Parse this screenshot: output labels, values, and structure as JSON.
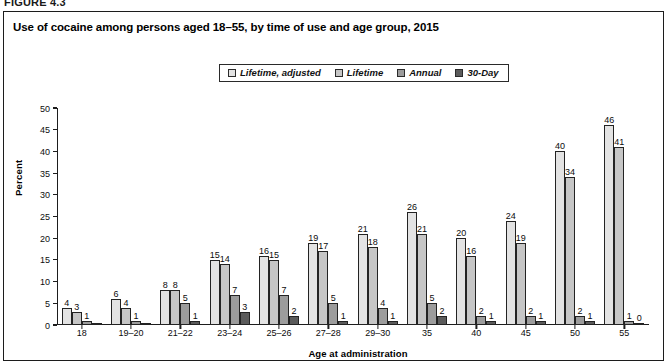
{
  "figure": {
    "label": "FIGURE 4.3"
  },
  "chart": {
    "title": "Use of cocaine among persons aged 18–55, by time of use and age group, 2015"
  },
  "legend": {
    "items": [
      {
        "label": "Lifetime, adjusted",
        "color": "#e3e3e3",
        "swatch_icon": "square-swatch-icon"
      },
      {
        "label": "Lifetime",
        "color": "#c6c6c6",
        "swatch_icon": "square-swatch-icon"
      },
      {
        "label": "Annual",
        "color": "#9c9c9c",
        "swatch_icon": "square-swatch-icon"
      },
      {
        "label": "30-Day",
        "color": "#5b5b5b",
        "swatch_icon": "square-swatch-icon"
      }
    ]
  },
  "chart_data": {
    "type": "bar",
    "title": "Use of cocaine among persons aged 18–55, by time of use and age group, 2015",
    "xlabel": "Age at administration",
    "ylabel": "Percent",
    "ylim": [
      0,
      50
    ],
    "yticks": [
      0,
      5,
      10,
      15,
      20,
      25,
      30,
      35,
      40,
      45,
      50
    ],
    "grid": false,
    "legend_position": "top-center",
    "categories": [
      "18",
      "19–20",
      "21–22",
      "23–24",
      "25–26",
      "27–28",
      "29–30",
      "35",
      "40",
      "45",
      "50",
      "55"
    ],
    "series": [
      {
        "name": "Lifetime, adjusted",
        "color": "#e3e3e3",
        "values": [
          4,
          6,
          8,
          15,
          16,
          19,
          21,
          26,
          20,
          24,
          40,
          46
        ],
        "labels": [
          "4",
          "6",
          "8",
          "15",
          "16",
          "19",
          "21",
          "26",
          "20",
          "24",
          "40",
          "46"
        ]
      },
      {
        "name": "Lifetime",
        "color": "#c6c6c6",
        "values": [
          3,
          4,
          8,
          14,
          15,
          17,
          18,
          21,
          16,
          19,
          34,
          41
        ],
        "labels": [
          "3",
          "4",
          "8",
          "14",
          "15",
          "17",
          "18",
          "21",
          "16",
          "19",
          "34",
          "41"
        ]
      },
      {
        "name": "Annual",
        "color": "#9c9c9c",
        "values": [
          1,
          1,
          5,
          7,
          7,
          5,
          4,
          5,
          2,
          2,
          2,
          1
        ],
        "labels": [
          "1",
          "1",
          "5",
          "7",
          "7",
          "5",
          "4",
          "5",
          "2",
          "2",
          "2",
          "1"
        ]
      },
      {
        "name": "30-Day",
        "color": "#5b5b5b",
        "values": [
          0.4,
          0.4,
          1,
          3,
          2,
          1,
          1,
          2,
          1,
          1,
          1,
          0.2
        ],
        "labels": [
          "",
          "",
          "1",
          "3",
          "2",
          "1",
          "1",
          "2",
          "1",
          "1",
          "1",
          "0"
        ]
      }
    ]
  }
}
